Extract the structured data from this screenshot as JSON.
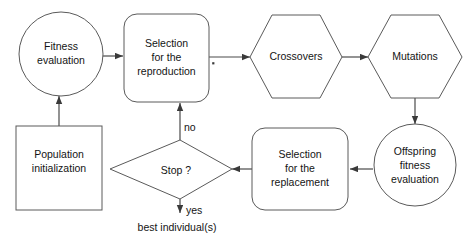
{
  "diagram": {
    "background_color": "#ffffff",
    "stroke_color": "#5a5a5a",
    "text_color": "#141414",
    "nodes": {
      "fitness_evaluation": {
        "shape": "circle",
        "line1": "Fitness",
        "line2": "evaluation"
      },
      "selection_reproduction": {
        "shape": "rounded-rect",
        "line1": "Selection",
        "line2": "for the",
        "line3": "reproduction"
      },
      "crossovers": {
        "shape": "hexagon",
        "line1": "Crossovers"
      },
      "mutations": {
        "shape": "hexagon",
        "line1": "Mutations"
      },
      "offspring_fitness_evaluation": {
        "shape": "circle",
        "line1": "Offspring",
        "line2": "fitness",
        "line3": "evaluation"
      },
      "selection_replacement": {
        "shape": "rounded-rect",
        "line1": "Selection",
        "line2": "for the",
        "line3": "replacement"
      },
      "stop_decision": {
        "shape": "diamond",
        "line1": "Stop ?"
      },
      "population_initialization": {
        "shape": "rect",
        "line1": "Population",
        "line2": "initialization"
      }
    },
    "edge_labels": {
      "no": "no",
      "yes": "yes"
    },
    "captions": {
      "output": "best individual(s)"
    },
    "annotations": {
      "asterisk_marker": "*"
    }
  }
}
